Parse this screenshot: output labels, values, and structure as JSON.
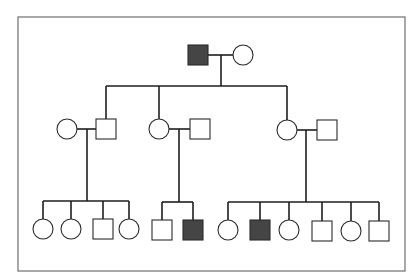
{
  "diagram": {
    "type": "pedigree",
    "colors": {
      "affected_fill": "#454545",
      "unaffected_fill": "#ffffff",
      "line": "#1e1e1e",
      "frame": "#6e6e6e"
    },
    "frame": {
      "x": 18,
      "y": 17,
      "w": 387,
      "h": 254
    },
    "symbol_size": 20,
    "generations": [
      {
        "id": "I",
        "individuals": [
          {
            "id": "I-1",
            "sex": "male",
            "affected": true,
            "cx": 198,
            "cy": 55
          },
          {
            "id": "I-2",
            "sex": "female",
            "affected": false,
            "cx": 243,
            "cy": 55
          }
        ]
      },
      {
        "id": "II",
        "individuals": [
          {
            "id": "II-1",
            "sex": "female",
            "affected": false,
            "cx": 67,
            "cy": 129
          },
          {
            "id": "II-2",
            "sex": "male",
            "affected": false,
            "cx": 106,
            "cy": 129
          },
          {
            "id": "II-3",
            "sex": "female",
            "affected": false,
            "cx": 159,
            "cy": 129
          },
          {
            "id": "II-4",
            "sex": "male",
            "affected": false,
            "cx": 200,
            "cy": 129
          },
          {
            "id": "II-5",
            "sex": "female",
            "affected": false,
            "cx": 287,
            "cy": 130
          },
          {
            "id": "II-6",
            "sex": "male",
            "affected": false,
            "cx": 327,
            "cy": 130
          }
        ]
      },
      {
        "id": "III",
        "individuals": [
          {
            "id": "III-1",
            "sex": "female",
            "affected": false,
            "cx": 43,
            "cy": 229
          },
          {
            "id": "III-2",
            "sex": "female",
            "affected": false,
            "cx": 71,
            "cy": 229
          },
          {
            "id": "III-3",
            "sex": "male",
            "affected": false,
            "cx": 103,
            "cy": 229
          },
          {
            "id": "III-4",
            "sex": "female",
            "affected": false,
            "cx": 129,
            "cy": 229
          },
          {
            "id": "III-5",
            "sex": "male",
            "affected": false,
            "cx": 162,
            "cy": 230
          },
          {
            "id": "III-6",
            "sex": "male",
            "affected": true,
            "cx": 193,
            "cy": 230
          },
          {
            "id": "III-7",
            "sex": "female",
            "affected": false,
            "cx": 228,
            "cy": 230
          },
          {
            "id": "III-8",
            "sex": "male",
            "affected": true,
            "cx": 260,
            "cy": 230
          },
          {
            "id": "III-9",
            "sex": "female",
            "affected": false,
            "cx": 289,
            "cy": 230
          },
          {
            "id": "III-10",
            "sex": "male",
            "affected": false,
            "cx": 322,
            "cy": 231
          },
          {
            "id": "III-11",
            "sex": "female",
            "affected": false,
            "cx": 351,
            "cy": 231
          },
          {
            "id": "III-12",
            "sex": "male",
            "affected": false,
            "cx": 379,
            "cy": 231
          }
        ]
      }
    ],
    "lines": [
      {
        "name": "mating-line-I",
        "x1": 208,
        "y1": 55,
        "x2": 233,
        "y2": 55
      },
      {
        "name": "descent-line-I",
        "x1": 221,
        "y1": 55,
        "x2": 221,
        "y2": 86
      },
      {
        "name": "sibship-line-II",
        "x1": 106,
        "y1": 86,
        "x2": 287,
        "y2": 86
      },
      {
        "name": "drop-II-2",
        "x1": 106,
        "y1": 86,
        "x2": 106,
        "y2": 119
      },
      {
        "name": "drop-II-3",
        "x1": 159,
        "y1": 86,
        "x2": 159,
        "y2": 119
      },
      {
        "name": "drop-II-5",
        "x1": 287,
        "y1": 86,
        "x2": 287,
        "y2": 120
      },
      {
        "name": "mating-line-II-a",
        "x1": 77,
        "y1": 129,
        "x2": 96,
        "y2": 129
      },
      {
        "name": "descent-line-II-a",
        "x1": 87,
        "y1": 129,
        "x2": 87,
        "y2": 201
      },
      {
        "name": "sibship-line-III-a",
        "x1": 43,
        "y1": 201,
        "x2": 129,
        "y2": 201
      },
      {
        "name": "drop-III-1",
        "x1": 43,
        "y1": 201,
        "x2": 43,
        "y2": 219
      },
      {
        "name": "drop-III-2",
        "x1": 71,
        "y1": 201,
        "x2": 71,
        "y2": 219
      },
      {
        "name": "drop-III-3",
        "x1": 103,
        "y1": 201,
        "x2": 103,
        "y2": 219
      },
      {
        "name": "drop-III-4",
        "x1": 129,
        "y1": 201,
        "x2": 129,
        "y2": 219
      },
      {
        "name": "mating-line-II-b",
        "x1": 169,
        "y1": 129,
        "x2": 190,
        "y2": 129
      },
      {
        "name": "descent-line-II-b",
        "x1": 179,
        "y1": 129,
        "x2": 179,
        "y2": 202
      },
      {
        "name": "sibship-line-III-b",
        "x1": 162,
        "y1": 202,
        "x2": 193,
        "y2": 202
      },
      {
        "name": "drop-III-5",
        "x1": 162,
        "y1": 202,
        "x2": 162,
        "y2": 220
      },
      {
        "name": "drop-III-6",
        "x1": 193,
        "y1": 202,
        "x2": 193,
        "y2": 220
      },
      {
        "name": "mating-line-II-c",
        "x1": 297,
        "y1": 130,
        "x2": 317,
        "y2": 130
      },
      {
        "name": "descent-line-II-c",
        "x1": 306,
        "y1": 130,
        "x2": 306,
        "y2": 202
      },
      {
        "name": "sibship-line-III-c",
        "x1": 228,
        "y1": 202,
        "x2": 379,
        "y2": 202
      },
      {
        "name": "drop-III-7",
        "x1": 228,
        "y1": 202,
        "x2": 228,
        "y2": 220
      },
      {
        "name": "drop-III-8",
        "x1": 260,
        "y1": 202,
        "x2": 260,
        "y2": 220
      },
      {
        "name": "drop-III-9",
        "x1": 289,
        "y1": 202,
        "x2": 289,
        "y2": 220
      },
      {
        "name": "drop-III-10",
        "x1": 322,
        "y1": 202,
        "x2": 322,
        "y2": 221
      },
      {
        "name": "drop-III-11",
        "x1": 351,
        "y1": 202,
        "x2": 351,
        "y2": 221
      },
      {
        "name": "drop-III-12",
        "x1": 379,
        "y1": 202,
        "x2": 379,
        "y2": 221
      }
    ]
  }
}
